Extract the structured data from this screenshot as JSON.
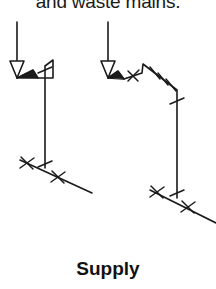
{
  "page": {
    "width": 216,
    "height": 289,
    "background_color": "#ffffff",
    "ink_color": "#1a1a1a"
  },
  "caption_top": {
    "text": "and waste mains.",
    "clipped": "top"
  },
  "caption_bottom": {
    "text": "Supply"
  },
  "diagram": {
    "title": "Supply",
    "kind": "isometric-piping-riser-diagram",
    "line_color": "#1a1a1a",
    "line_width": 1.6,
    "risers": [
      {
        "name": "left-riser",
        "inlet_arrow": {
          "stem_from": [
            17,
            22
          ],
          "stem_to": [
            17,
            60
          ],
          "head_points": "10,62 24,62 17,78"
        },
        "pipe_path": "M 17,78 L 33,70 L 38,78 L 53,78 L 53,60 L 45,66 L 45,168",
        "segments": [
          {
            "from": [
              17,
              78
            ],
            "to": [
              33,
              70
            ]
          },
          {
            "from": [
              33,
              70
            ],
            "to": [
              38,
              78
            ]
          },
          {
            "from": [
              38,
              78
            ],
            "to": [
              53,
              78
            ]
          },
          {
            "from": [
              53,
              78
            ],
            "to": [
              53,
              60
            ]
          },
          {
            "from": [
              53,
              60
            ],
            "to": [
              45,
              66
            ]
          },
          {
            "from": [
              45,
              66
            ],
            "to": [
              45,
              168
            ]
          },
          {
            "from": [
              20,
              160
            ],
            "to": [
              90,
              192
            ]
          }
        ],
        "fittings": [
          {
            "type": "cross-tick",
            "at": [
              45,
              70
            ],
            "angle": 20
          },
          {
            "type": "cross-tick",
            "at": [
              45,
              164
            ],
            "angle": 20
          },
          {
            "type": "cross-tick",
            "at": [
              27,
              163
            ],
            "angle": 114
          },
          {
            "type": "cross-tick",
            "at": [
              58,
              177
            ],
            "angle": 114
          }
        ]
      },
      {
        "name": "right-riser",
        "inlet_arrow": {
          "stem_from": [
            108,
            22
          ],
          "stem_to": [
            108,
            60
          ],
          "head_points": "101,62 115,62 108,78"
        },
        "pipe_path": "M 108,78 L 118,72 L 123,79 L 142,74 L 143,64 L 177,90 L 177,198",
        "segments": [
          {
            "from": [
              108,
              78
            ],
            "to": [
              118,
              72
            ]
          },
          {
            "from": [
              118,
              72
            ],
            "to": [
              123,
              79
            ]
          },
          {
            "from": [
              123,
              79
            ],
            "to": [
              142,
              74
            ]
          },
          {
            "from": [
              142,
              74
            ],
            "to": [
              143,
              64
            ]
          },
          {
            "from": [
              143,
              64
            ],
            "to": [
              177,
              90
            ]
          },
          {
            "from": [
              177,
              90
            ],
            "to": [
              177,
              198
            ]
          },
          {
            "from": [
              150,
              190
            ],
            "to": [
              216,
              222
            ]
          }
        ],
        "fittings": [
          {
            "type": "cross-tick",
            "at": [
              133,
              76
            ],
            "angle": 108
          },
          {
            "type": "cross-tick",
            "at": [
              155,
              73
            ],
            "angle": 122
          },
          {
            "type": "cross-tick",
            "at": [
              161,
              79
            ],
            "angle": 122
          },
          {
            "type": "cross-tick",
            "at": [
              172,
              86
            ],
            "angle": 122
          },
          {
            "type": "cross-tick",
            "at": [
              177,
              101
            ],
            "angle": 20
          },
          {
            "type": "cross-tick",
            "at": [
              177,
              193
            ],
            "angle": 20
          },
          {
            "type": "cross-tick",
            "at": [
              157,
              192
            ],
            "angle": 114
          },
          {
            "type": "cross-tick",
            "at": [
              188,
              207
            ],
            "angle": 114
          }
        ]
      }
    ]
  }
}
